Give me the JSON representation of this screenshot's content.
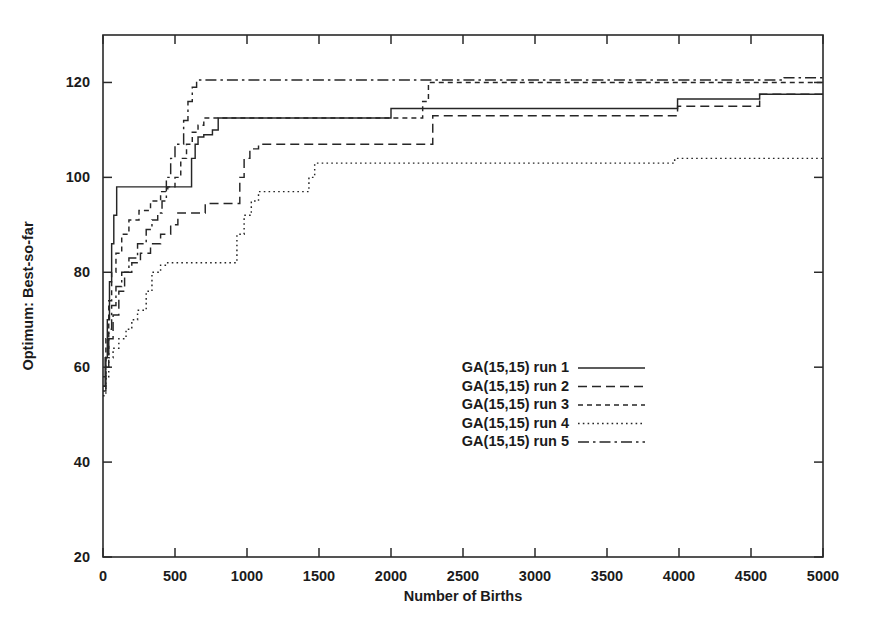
{
  "chart_data": {
    "type": "line",
    "title": "",
    "xlabel": "Number of Births",
    "ylabel": "Optimum: Best-so-far",
    "xlim": [
      0,
      5000
    ],
    "ylim": [
      20,
      130
    ],
    "xticks": [
      0,
      500,
      1000,
      1500,
      2000,
      2500,
      3000,
      3500,
      4000,
      4500,
      5000
    ],
    "xtick_labels": [
      "0",
      "500",
      "1000",
      "1500",
      "2000",
      "2500",
      "3000",
      "3500",
      "4000",
      "4500",
      "5000"
    ],
    "yticks": [
      20,
      40,
      60,
      80,
      100,
      120
    ],
    "ytick_labels": [
      "20",
      "40",
      "60",
      "80",
      "100",
      "120"
    ],
    "grid": false,
    "legend_position": "center",
    "series": [
      {
        "name": "GA(15,15) run 1",
        "style": "solid",
        "dasharray": "none",
        "points": [
          [
            0,
            56
          ],
          [
            15,
            62
          ],
          [
            30,
            70
          ],
          [
            45,
            78
          ],
          [
            60,
            86
          ],
          [
            75,
            92
          ],
          [
            95,
            98
          ],
          [
            600,
            98
          ],
          [
            615,
            104
          ],
          [
            640,
            107
          ],
          [
            660,
            108.5
          ],
          [
            700,
            109
          ],
          [
            760,
            110
          ],
          [
            800,
            112.5
          ],
          [
            1980,
            112.5
          ],
          [
            2000,
            114.5
          ],
          [
            3960,
            114.5
          ],
          [
            3990,
            116.5
          ],
          [
            4530,
            116.5
          ],
          [
            4560,
            117.5
          ],
          [
            5000,
            117.5
          ]
        ]
      },
      {
        "name": "GA(15,15) run 2",
        "style": "dashed",
        "dasharray": "9,5",
        "points": [
          [
            0,
            55
          ],
          [
            20,
            60
          ],
          [
            40,
            66
          ],
          [
            70,
            71
          ],
          [
            110,
            76
          ],
          [
            150,
            80
          ],
          [
            200,
            82
          ],
          [
            260,
            84
          ],
          [
            330,
            86
          ],
          [
            400,
            88
          ],
          [
            470,
            90
          ],
          [
            520,
            92.5
          ],
          [
            690,
            92.5
          ],
          [
            710,
            94.5
          ],
          [
            930,
            94.5
          ],
          [
            950,
            100
          ],
          [
            980,
            104
          ],
          [
            1020,
            106
          ],
          [
            1080,
            107
          ],
          [
            2260,
            107
          ],
          [
            2290,
            113
          ],
          [
            3960,
            113
          ],
          [
            3990,
            115
          ],
          [
            4530,
            115
          ],
          [
            4560,
            117.5
          ],
          [
            5000,
            117.5
          ]
        ]
      },
      {
        "name": "GA(15,15) run 3",
        "style": "short-dashed",
        "dasharray": "5,4",
        "points": [
          [
            0,
            58
          ],
          [
            20,
            66
          ],
          [
            40,
            74
          ],
          [
            60,
            80
          ],
          [
            90,
            84
          ],
          [
            130,
            88
          ],
          [
            180,
            91
          ],
          [
            250,
            93
          ],
          [
            330,
            95
          ],
          [
            400,
            97
          ],
          [
            450,
            98
          ],
          [
            500,
            100
          ],
          [
            540,
            104
          ],
          [
            580,
            107
          ],
          [
            620,
            109.5
          ],
          [
            660,
            111
          ],
          [
            700,
            112.5
          ],
          [
            2180,
            112.5
          ],
          [
            2220,
            116
          ],
          [
            2260,
            120
          ],
          [
            5000,
            120
          ]
        ]
      },
      {
        "name": "GA(15,15) run 4",
        "style": "dotted",
        "dasharray": "1.6,3.2",
        "points": [
          [
            0,
            54
          ],
          [
            20,
            58
          ],
          [
            40,
            62
          ],
          [
            70,
            64
          ],
          [
            110,
            66
          ],
          [
            160,
            68
          ],
          [
            200,
            70
          ],
          [
            240,
            72
          ],
          [
            300,
            76
          ],
          [
            340,
            80
          ],
          [
            400,
            81.5
          ],
          [
            440,
            82
          ],
          [
            900,
            82
          ],
          [
            930,
            88
          ],
          [
            980,
            92
          ],
          [
            1030,
            95
          ],
          [
            1080,
            97
          ],
          [
            1400,
            97
          ],
          [
            1430,
            100
          ],
          [
            1470,
            103
          ],
          [
            3930,
            103
          ],
          [
            3970,
            104
          ],
          [
            5000,
            104
          ]
        ]
      },
      {
        "name": "GA(15,15) run 5",
        "style": "dash-dot",
        "dasharray": "11,4,2.5,4",
        "points": [
          [
            0,
            56
          ],
          [
            20,
            62
          ],
          [
            40,
            68
          ],
          [
            60,
            73
          ],
          [
            90,
            77
          ],
          [
            130,
            80
          ],
          [
            180,
            83
          ],
          [
            240,
            86
          ],
          [
            300,
            89
          ],
          [
            340,
            91
          ],
          [
            380,
            92.5
          ],
          [
            410,
            95
          ],
          [
            440,
            100
          ],
          [
            470,
            104
          ],
          [
            500,
            107
          ],
          [
            540,
            107
          ],
          [
            560,
            112
          ],
          [
            590,
            116
          ],
          [
            620,
            119
          ],
          [
            650,
            120.5
          ],
          [
            4700,
            120.5
          ],
          [
            4730,
            121
          ],
          [
            5000,
            121
          ]
        ]
      }
    ]
  },
  "legend": {
    "entries": [
      {
        "label": "GA(15,15) run 1",
        "sample": "solid-line-sample"
      },
      {
        "label": "GA(15,15) run 2",
        "sample": "dashed-line-sample"
      },
      {
        "label": "GA(15,15) run 3",
        "sample": "short-dashed-line-sample"
      },
      {
        "label": "GA(15,15) run 4",
        "sample": "dotted-line-sample"
      },
      {
        "label": "GA(15,15) run 5",
        "sample": "dash-dot-line-sample"
      }
    ]
  },
  "colors": {
    "line": "#262626",
    "frame": "#2a2a2a",
    "text": "#1b1b1b",
    "background": "#ffffff"
  }
}
